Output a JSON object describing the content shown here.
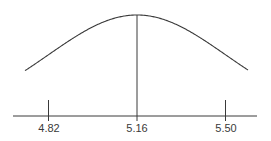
{
  "chart_data": {
    "type": "line",
    "title": "",
    "xlabel": "",
    "ylabel": "",
    "distribution": {
      "mean": 5.16,
      "sd": 0.34
    },
    "tick_labels": [
      "4.82",
      "5.16",
      "5.50"
    ],
    "ticks": [
      4.82,
      5.16,
      5.5
    ],
    "grid": false,
    "legend": null
  },
  "colors": {
    "curve": "#3a3a3a",
    "axis": "#3a3a3a",
    "background": "#ffffff"
  }
}
